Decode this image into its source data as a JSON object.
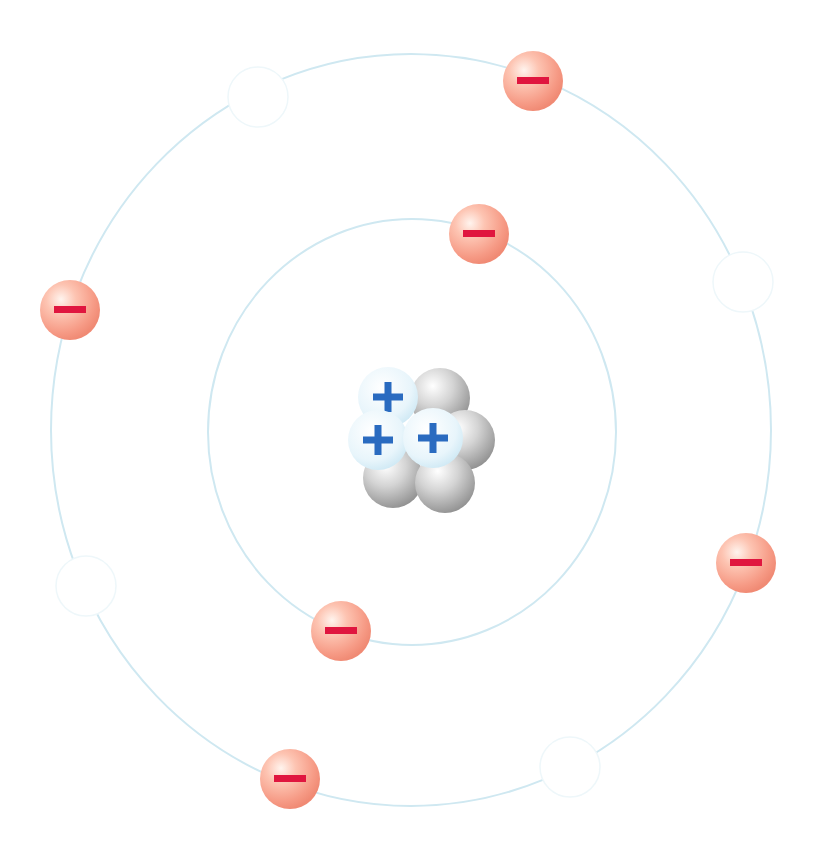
{
  "diagram": {
    "type": "bohr-atom-model",
    "element_hint": "lithium-like nucleus with 3 protons and 4 neutrons",
    "colors": {
      "orbit": "#cfe8f1",
      "electron_light": "#ffe6dc",
      "electron_mid": "#fca08c",
      "electron_dark": "#f07a66",
      "electron_sign": "#e0163f",
      "proton_light": "#ffffff",
      "proton_dark": "#d6eef8",
      "proton_sign": "#2a6bc0",
      "neutron_light": "#ffffff",
      "neutron_dark": "#9a9a9a",
      "hole_stroke": "#eef7fa"
    },
    "orbits": [
      {
        "name": "inner-orbit",
        "cx": 412,
        "cy": 432,
        "rx": 204,
        "ry": 213
      },
      {
        "name": "outer-orbit",
        "cx": 411,
        "cy": 430,
        "rx": 360,
        "ry": 376
      }
    ],
    "electrons": [
      {
        "orbit": "outer",
        "cx": 533,
        "cy": 81,
        "r": 30,
        "sign": "−"
      },
      {
        "orbit": "inner",
        "cx": 479,
        "cy": 234,
        "r": 30,
        "sign": "−"
      },
      {
        "orbit": "outer",
        "cx": 70,
        "cy": 310,
        "r": 30,
        "sign": "−"
      },
      {
        "orbit": "outer",
        "cx": 746,
        "cy": 563,
        "r": 30,
        "sign": "−"
      },
      {
        "orbit": "inner",
        "cx": 341,
        "cy": 631,
        "r": 30,
        "sign": "−"
      },
      {
        "orbit": "outer",
        "cx": 290,
        "cy": 779,
        "r": 30,
        "sign": "−"
      }
    ],
    "holes": [
      {
        "orbit": "outer",
        "cx": 258,
        "cy": 97,
        "r": 30
      },
      {
        "orbit": "outer",
        "cx": 743,
        "cy": 282,
        "r": 30
      },
      {
        "orbit": "outer",
        "cx": 86,
        "cy": 586,
        "r": 30
      },
      {
        "orbit": "outer",
        "cx": 570,
        "cy": 767,
        "r": 30
      }
    ],
    "nucleus": {
      "neutrons": [
        {
          "cx": 440,
          "cy": 398,
          "r": 30
        },
        {
          "cx": 465,
          "cy": 440,
          "r": 30
        },
        {
          "cx": 393,
          "cy": 478,
          "r": 30
        },
        {
          "cx": 445,
          "cy": 483,
          "r": 30
        }
      ],
      "protons": [
        {
          "cx": 388,
          "cy": 397,
          "r": 30,
          "sign": "+"
        },
        {
          "cx": 378,
          "cy": 440,
          "r": 30,
          "sign": "+"
        },
        {
          "cx": 433,
          "cy": 438,
          "r": 30,
          "sign": "+"
        }
      ]
    },
    "counts": {
      "protons": 3,
      "neutrons": 4,
      "electrons": 6
    }
  }
}
